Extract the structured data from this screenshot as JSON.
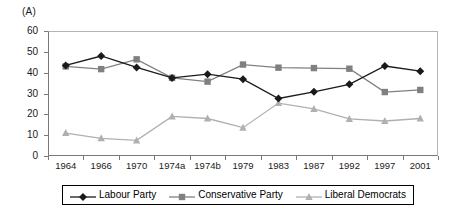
{
  "chart_data": {
    "type": "line",
    "title": "(A)",
    "xlabel": "",
    "ylabel": "",
    "ylim": [
      0,
      60
    ],
    "yticks": [
      0,
      10,
      20,
      30,
      40,
      50,
      60
    ],
    "grid": false,
    "legend_position": "bottom",
    "categories": [
      "1964",
      "1966",
      "1970",
      "1974a",
      "1974b",
      "1979",
      "1983",
      "1987",
      "1992",
      "1997",
      "2001"
    ],
    "series": [
      {
        "name": "Labour Party",
        "color": "#1a1a1a",
        "marker": "diamond",
        "values": [
          43.5,
          48.0,
          42.5,
          37.5,
          39.3,
          36.9,
          27.6,
          30.8,
          34.4,
          43.2,
          40.7
        ]
      },
      {
        "name": "Conservative Party",
        "color": "#808080",
        "marker": "square",
        "values": [
          43.0,
          41.7,
          46.4,
          37.5,
          35.7,
          43.9,
          42.4,
          42.2,
          41.9,
          30.7,
          31.7
        ]
      },
      {
        "name": "Liberal Democrats",
        "color": "#b0b0b0",
        "marker": "triangle",
        "values": [
          11.0,
          8.5,
          7.5,
          19.0,
          18.0,
          13.6,
          25.4,
          22.6,
          17.8,
          16.8,
          18.0
        ]
      }
    ]
  },
  "legend": {
    "items": [
      {
        "label": "Labour Party"
      },
      {
        "label": "Conservative Party"
      },
      {
        "label": "Liberal Democrats"
      }
    ]
  }
}
